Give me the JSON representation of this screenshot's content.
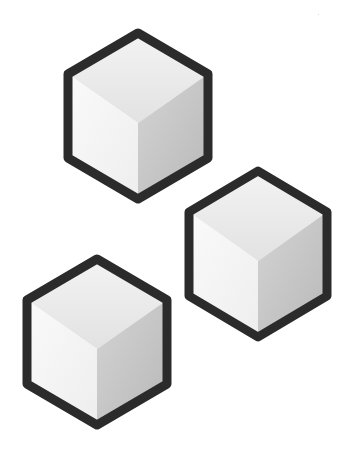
{
  "scene": {
    "title": "",
    "background": "#ffffff",
    "stroke_color": "#2b2b2b",
    "stroke_width": 9,
    "colors": {
      "top_light": "#f3f3f3",
      "top_dark": "#e2e2e2",
      "left_light": "#fafafa",
      "left_dark": "#efefef",
      "right_light": "#d2d2d2",
      "right_dark": "#b9b9b9"
    },
    "cubes": [
      {
        "id": "cube-top",
        "cx": 138,
        "cy": 116,
        "hw": 70,
        "hh": 83,
        "side": 42,
        "inner": 7
      },
      {
        "id": "cube-right",
        "cx": 258,
        "cy": 254,
        "hw": 69,
        "hh": 83,
        "side": 42,
        "inner": 7
      },
      {
        "id": "cube-bottom-left",
        "cx": 97,
        "cy": 342,
        "hw": 70,
        "hh": 83,
        "side": 42,
        "inner": 7
      }
    ]
  }
}
